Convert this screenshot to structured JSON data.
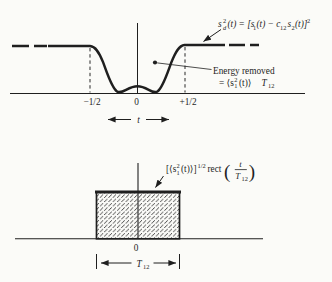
{
  "figure": {
    "background": "#fbfbf8",
    "ink": "#1f1f1f"
  },
  "top_plot": {
    "formula": {
      "s": "s",
      "s_sup": "2",
      "s_sub": "d",
      "seg2": "(t) = [s",
      "sub1": "1",
      "seg3": "(t) − c",
      "sub12": "12",
      "s2": "s",
      "sub2": "2",
      "seg4": "(t)]",
      "sup2": "2"
    },
    "energy_note": {
      "line1": "Energy removed",
      "eq": "= ⟨s",
      "sup": "2",
      "sub": "1",
      "close": "(t)⟩",
      "T": "T",
      "T_sub": "12"
    },
    "ticks": {
      "minus_half": "−1/2",
      "zero": "0",
      "plus_half": "+1/2"
    },
    "t_label": "t"
  },
  "bottom_plot": {
    "formula": {
      "open": "[⟨s",
      "sup": "2",
      "sub": "1",
      "close": "(t)⟩]",
      "exp": "1/2",
      "rect_word": "rect",
      "paren_left": "(",
      "frac_num": "t",
      "frac_den": "T",
      "frac_den_sub": "12",
      "paren_right": ")"
    },
    "zero": "0",
    "width_label": {
      "T": "T",
      "sub": "12"
    }
  }
}
